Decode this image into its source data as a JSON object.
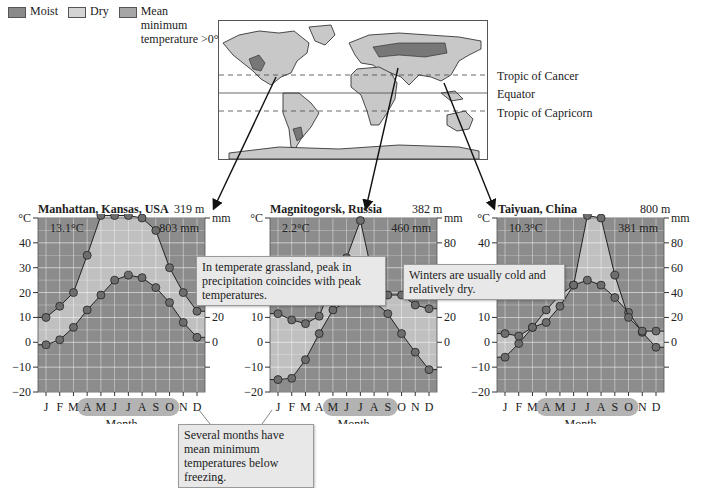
{
  "legend": {
    "items": [
      {
        "label": "Moist",
        "color": "#8a8a8a"
      },
      {
        "label": "Dry",
        "color": "#d2d2d2"
      },
      {
        "label": "Mean minimum temperature >0°C",
        "color": "#a8a8a8"
      }
    ],
    "moist": "Moist",
    "dry": "Dry",
    "mean_line1": "Mean",
    "mean_line2": "minimum",
    "mean_line3": "temperature >0°C"
  },
  "map": {
    "lines": {
      "tropic_cancer": "Tropic of Cancer",
      "equator": "Equator",
      "tropic_capricorn": "Tropic of Capricorn"
    }
  },
  "callouts": {
    "grassland": "In temperate grassland, peak in precipitation coincides with peak temperatures.",
    "winters": "Winters are usually cold and relatively dry.",
    "freezing": "Several months have mean minimum temperatures below freezing."
  },
  "axis": {
    "celsius_label": "°C",
    "mm_label": "mm",
    "xlabel": "Month"
  },
  "chart_data": [
    {
      "type": "line",
      "title": "Manhattan, Kansas, USA",
      "elevation": "319 m",
      "mean_temp": "13.1°C",
      "annual_precip": "803 mm",
      "categories": [
        "J",
        "F",
        "M",
        "A",
        "M",
        "J",
        "J",
        "A",
        "S",
        "O",
        "N",
        "D"
      ],
      "series": [
        {
          "name": "Temperature (°C)",
          "values": [
            -1,
            1,
            6,
            13,
            19,
            25,
            27,
            26,
            22,
            16,
            8,
            2
          ]
        },
        {
          "name": "Precipitation (mm)",
          "values": [
            20,
            29,
            40,
            70,
            102,
            102,
            102,
            100,
            90,
            60,
            40,
            25
          ]
        }
      ],
      "highlighted_months": [
        "A",
        "M",
        "J",
        "J",
        "A",
        "S",
        "O"
      ],
      "ylabel": "°C",
      "ylim": [
        -20,
        50
      ],
      "yticks": [
        -20,
        -10,
        0,
        10,
        20,
        30,
        40
      ],
      "y2label": "mm",
      "y2ticks": [
        0,
        20,
        40
      ],
      "xlabel": "Month",
      "grid": true
    },
    {
      "type": "line",
      "title": "Magnitogorsk, Russia",
      "elevation": "382 m",
      "mean_temp": "2.2°C",
      "annual_precip": "460 mm",
      "categories": [
        "J",
        "F",
        "M",
        "A",
        "M",
        "J",
        "J",
        "A",
        "S",
        "O",
        "N",
        "D"
      ],
      "series": [
        {
          "name": "Temperature (°C)",
          "values": [
            -15,
            -14.5,
            -7,
            3.5,
            13,
            16.5,
            19,
            16.5,
            11.5,
            3.5,
            -4,
            -11
          ]
        },
        {
          "name": "Precipitation (mm)",
          "values": [
            23,
            18,
            15,
            21,
            48,
            68,
            98,
            48,
            38,
            38,
            30,
            27
          ]
        }
      ],
      "highlighted_months": [
        "M",
        "J",
        "J",
        "A",
        "S"
      ],
      "ylabel": "°C",
      "ylim": [
        -20,
        50
      ],
      "yticks": [
        -20,
        -10,
        0,
        10,
        20
      ],
      "y2label": "mm",
      "y2ticks": [
        0,
        20,
        40,
        80
      ],
      "xlabel": "Month",
      "grid": true
    },
    {
      "type": "line",
      "title": "Taiyuan, China",
      "elevation": "800 m",
      "mean_temp": "10.3°C",
      "annual_precip": "381 mm",
      "categories": [
        "J",
        "F",
        "M",
        "A",
        "M",
        "J",
        "J",
        "A",
        "S",
        "O",
        "N",
        "D"
      ],
      "series": [
        {
          "name": "Temperature (°C)",
          "values": [
            -6,
            -0.5,
            6,
            13,
            19,
            23,
            25,
            23,
            18,
            12,
            4,
            -2
          ]
        },
        {
          "name": "Precipitation (mm)",
          "values": [
            7,
            5,
            12,
            16,
            29,
            46,
            102,
            100,
            54,
            20,
            9,
            9
          ]
        }
      ],
      "highlighted_months": [
        "A",
        "M",
        "J",
        "J",
        "A",
        "S",
        "O"
      ],
      "ylabel": "°C",
      "ylim": [
        -20,
        50
      ],
      "yticks": [
        -20,
        -10,
        0,
        10,
        20,
        40
      ],
      "y2label": "mm",
      "y2ticks": [
        0,
        20,
        40,
        60,
        80
      ],
      "xlabel": "Month",
      "grid": true
    }
  ]
}
